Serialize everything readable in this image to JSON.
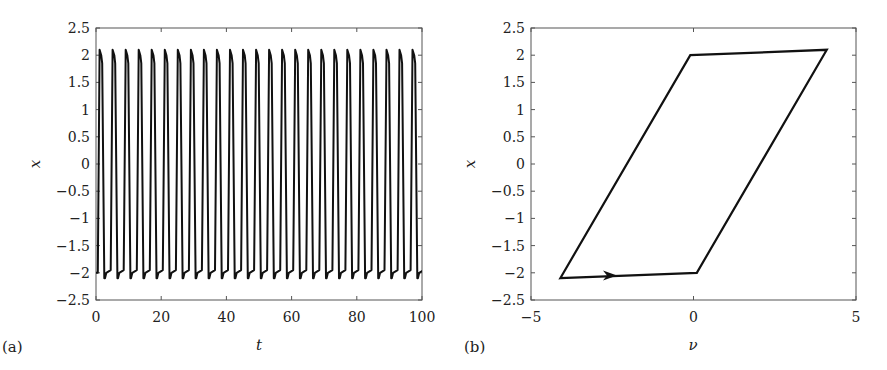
{
  "chart_data": [
    {
      "panel": "(a)",
      "type": "line",
      "title": "",
      "xlabel": "t",
      "ylabel": "x",
      "xlim": [
        0,
        100
      ],
      "ylim": [
        -2.5,
        2.5
      ],
      "xticks": [
        0,
        20,
        40,
        60,
        80,
        100
      ],
      "xtick_labels": [
        "0",
        "20",
        "40",
        "60",
        "80",
        "100"
      ],
      "yticks": [
        2.5,
        2,
        1.5,
        1,
        0.5,
        0,
        -0.5,
        -1,
        -1.5,
        -2,
        -2.5
      ],
      "ytick_labels": [
        "2.5",
        "2",
        "1.5",
        "1",
        "0.5",
        "0",
        "−0.5",
        "−1",
        "−1.5",
        "−2",
        "−2.5"
      ],
      "grid": false,
      "series": [
        {
          "name": "x(t)",
          "description": "Relaxation oscillation, square-like wave between about -2.1 and 2.1",
          "period": 4.0,
          "amplitude_high": 2.1,
          "plateau_high": 2.0,
          "amplitude_low": -2.1,
          "plateau_low": -2.0,
          "start_value": -2.0,
          "cycles": 25
        }
      ]
    },
    {
      "panel": "(b)",
      "type": "line",
      "title": "",
      "xlabel": "ν",
      "ylabel": "x",
      "xlim": [
        -5,
        5
      ],
      "ylim": [
        -2.5,
        2.5
      ],
      "xticks": [
        -5,
        0,
        5
      ],
      "xtick_labels": [
        "−5",
        "0",
        "5"
      ],
      "yticks": [
        2.5,
        2,
        1.5,
        1,
        0.5,
        0,
        -0.5,
        -1,
        -1.5,
        -2,
        -2.5
      ],
      "ytick_labels": [
        "2.5",
        "2",
        "1.5",
        "1",
        "0.5",
        "0",
        "−0.5",
        "−1",
        "−1.5",
        "−2",
        "−2.5"
      ],
      "grid": false,
      "series": [
        {
          "name": "phase portrait",
          "description": "Closed parallelogram limit cycle traversed clockwise",
          "x": [
            -4.1,
            0.1,
            4.1,
            -0.1,
            -4.1
          ],
          "y": [
            -2.1,
            -2.0,
            2.1,
            2.0,
            -2.1
          ]
        }
      ],
      "annotations": [
        {
          "type": "arrow",
          "at": [
            -2.6,
            -2.05
          ],
          "direction": "right"
        }
      ]
    }
  ],
  "panels": {
    "a": {
      "label": "(a)",
      "xlabel": "t",
      "ylabel": "x"
    },
    "b": {
      "label": "(b)",
      "xlabel": "ν",
      "ylabel": "x"
    }
  }
}
